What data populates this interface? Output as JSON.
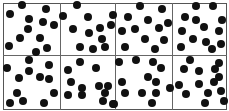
{
  "figure": {
    "rows": 2,
    "cols": 4,
    "line_color": "#666666",
    "dot_color": "#111111",
    "dot_radius": 4,
    "column_dividers_x": [
      60,
      115,
      172
    ],
    "row_divider_y": 55
  },
  "panels": [
    {
      "row": 0,
      "col": 0,
      "dots": [
        [
          22,
          5
        ],
        [
          10,
          14
        ],
        [
          46,
          9
        ],
        [
          29,
          19
        ],
        [
          43,
          22
        ],
        [
          54,
          25
        ],
        [
          28,
          29
        ],
        [
          20,
          38
        ],
        [
          40,
          38
        ],
        [
          9,
          46
        ],
        [
          47,
          48
        ],
        [
          36,
          52
        ]
      ]
    },
    {
      "row": 0,
      "col": 1,
      "dots": [
        [
          77,
          5
        ],
        [
          63,
          16
        ],
        [
          88,
          17
        ],
        [
          113,
          15
        ],
        [
          111,
          25
        ],
        [
          73,
          29
        ],
        [
          89,
          33
        ],
        [
          100,
          28
        ],
        [
          102,
          39
        ],
        [
          80,
          47
        ],
        [
          93,
          49
        ],
        [
          105,
          47
        ]
      ]
    },
    {
      "row": 0,
      "col": 2,
      "dots": [
        [
          140,
          6
        ],
        [
          162,
          9
        ],
        [
          128,
          17
        ],
        [
          148,
          20
        ],
        [
          168,
          23
        ],
        [
          122,
          31
        ],
        [
          135,
          29
        ],
        [
          159,
          28
        ],
        [
          145,
          39
        ],
        [
          164,
          40
        ],
        [
          125,
          47
        ],
        [
          155,
          49
        ]
      ]
    },
    {
      "row": 0,
      "col": 3,
      "dots": [
        [
          196,
          6
        ],
        [
          213,
          6
        ],
        [
          185,
          17
        ],
        [
          196,
          20
        ],
        [
          204,
          27
        ],
        [
          222,
          20
        ],
        [
          182,
          31
        ],
        [
          219,
          31
        ],
        [
          193,
          39
        ],
        [
          206,
          42
        ],
        [
          221,
          44
        ],
        [
          181,
          47
        ],
        [
          212,
          49
        ]
      ]
    },
    {
      "row": 1,
      "col": 0,
      "dots": [
        [
          29,
          60
        ],
        [
          7,
          68
        ],
        [
          29,
          71
        ],
        [
          49,
          65
        ],
        [
          19,
          78
        ],
        [
          40,
          77
        ],
        [
          49,
          79
        ],
        [
          17,
          93
        ],
        [
          54,
          93
        ],
        [
          10,
          103
        ],
        [
          23,
          101
        ],
        [
          44,
          103
        ]
      ]
    },
    {
      "row": 1,
      "col": 1,
      "dots": [
        [
          80,
          62
        ],
        [
          68,
          70
        ],
        [
          96,
          68
        ],
        [
          71,
          82
        ],
        [
          82,
          88
        ],
        [
          99,
          86
        ],
        [
          108,
          86
        ],
        [
          68,
          95
        ],
        [
          82,
          95
        ],
        [
          105,
          93
        ],
        [
          103,
          101
        ],
        [
          113,
          104
        ]
      ]
    },
    {
      "row": 1,
      "col": 2,
      "dots": [
        [
          119,
          62
        ],
        [
          136,
          60
        ],
        [
          153,
          62
        ],
        [
          161,
          68
        ],
        [
          148,
          77
        ],
        [
          156,
          82
        ],
        [
          122,
          82
        ],
        [
          125,
          93
        ],
        [
          142,
          93
        ],
        [
          156,
          93
        ],
        [
          170,
          88
        ],
        [
          152,
          103
        ],
        [
          114,
          104
        ]
      ]
    },
    {
      "row": 1,
      "col": 3,
      "dots": [
        [
          190,
          60
        ],
        [
          219,
          63
        ],
        [
          184,
          69
        ],
        [
          199,
          71
        ],
        [
          215,
          69
        ],
        [
          219,
          77
        ],
        [
          199,
          84
        ],
        [
          214,
          82
        ],
        [
          186,
          94
        ],
        [
          208,
          93
        ],
        [
          221,
          91
        ],
        [
          179,
          85
        ],
        [
          205,
          103
        ],
        [
          224,
          101
        ]
      ]
    }
  ]
}
